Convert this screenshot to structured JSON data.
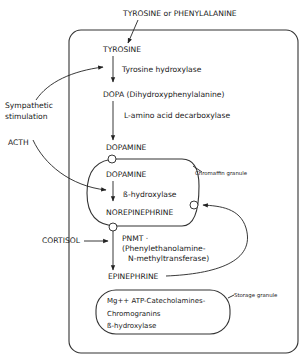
{
  "diagram": {
    "source_label": "TYROSINE or PHENYLALANINE",
    "cell": {
      "tyrosine": "TYROSINE",
      "enzyme1": "Tyrosine hydroxylase",
      "dopa": "DOPA (Dihydroxyphenylalanine)",
      "enzyme2": "L-amino acid decarboxylase",
      "dopamine": "DOPAMINE"
    },
    "chromaffin_granule": {
      "label": "Chromaffin granule",
      "dopamine": "DOPAMINE",
      "enzyme": "ß-hydroxylase",
      "norepinephrine": "NOREPINEPHRINE"
    },
    "pnmt": {
      "line1": "PNMT ·",
      "line2": "(Phenylethanolamine-",
      "line3": "N-methyltransferase)"
    },
    "epinephrine": "EPINEPHRINE",
    "storage_granule": {
      "label": "Storage granule",
      "line1": "Mg++ ATP-Catecholamines-",
      "line2": "Chromogranins",
      "line3": "ß-hydroxylase"
    },
    "external": {
      "sympathetic_line1": "Sympathetic",
      "sympathetic_line2": "stimulation",
      "acth": "ACTH",
      "cortisol": "CORTISOL"
    }
  }
}
